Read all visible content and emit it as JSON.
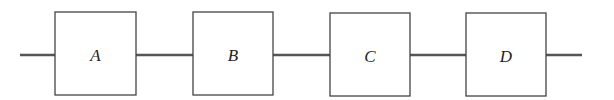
{
  "diagram": {
    "type": "series-block-chain",
    "blocks": [
      {
        "id": "A",
        "label": "A"
      },
      {
        "id": "B",
        "label": "B"
      },
      {
        "id": "C",
        "label": "C"
      },
      {
        "id": "D",
        "label": "D"
      }
    ],
    "connections": [
      {
        "from": "input",
        "to": "A"
      },
      {
        "from": "A",
        "to": "B"
      },
      {
        "from": "B",
        "to": "C"
      },
      {
        "from": "C",
        "to": "D"
      },
      {
        "from": "D",
        "to": "output"
      }
    ]
  }
}
